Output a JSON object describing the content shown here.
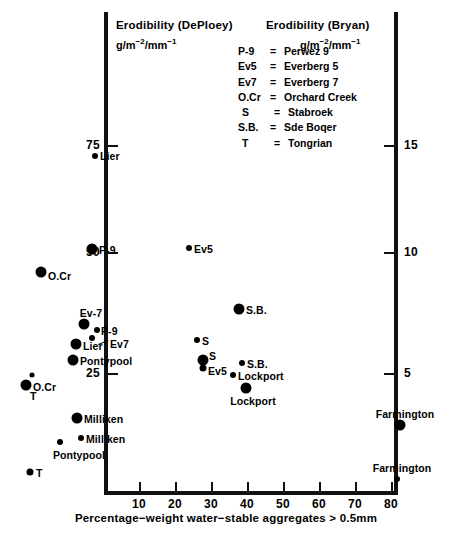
{
  "axes": {
    "left_title": "Erodibility (DePloey)",
    "left_units_html": "g/m",
    "right_title": "Erodibility (Bryan)",
    "right_units_html": "g/m",
    "x_title": "Percentage−weight water−stable aggregates  >  0.5mm",
    "left_ticks": [
      "75",
      "50",
      "25"
    ],
    "right_ticks": [
      "15",
      "10",
      "5"
    ],
    "x_ticks": [
      "10",
      "20",
      "30",
      "40",
      "50",
      "60",
      "70",
      "80"
    ]
  },
  "legend": {
    "rows": [
      {
        "key": "P-9",
        "eq": "=",
        "value": "Perwez 9"
      },
      {
        "key": "Ev5",
        "eq": "=",
        "value": "Everberg 5"
      },
      {
        "key": "Ev7",
        "eq": "=",
        "value": "Everberg 7"
      },
      {
        "key": "O.Cr",
        "eq": "=",
        "value": "Orchard Creek"
      },
      {
        "key": "S",
        "eq": "=",
        "value": "Stabroek"
      },
      {
        "key": "S.B.",
        "eq": "=",
        "value": "Sde Boqer"
      },
      {
        "key": "T",
        "eq": "=",
        "value": "Tongrian"
      }
    ]
  },
  "chart_data": {
    "type": "scatter",
    "title": "",
    "xlabel": "Percentage−weight water−stable aggregates > 0.5mm",
    "ylabel_left": "Erodibility (DePloey) g/m^-2/mm^-1",
    "ylabel_right": "Erodibility (Bryan) g/m^-2/mm^-1",
    "xlim": [
      0,
      86
    ],
    "ylim_left": [
      0,
      86
    ],
    "ylim_right": [
      0,
      17.2
    ],
    "grid": false,
    "legend_position": "top-right",
    "series": [
      {
        "name": "DePloey (large markers, left axis)",
        "marker": "filled-circle-large",
        "axis": "left",
        "points": [
          {
            "label": "P-9",
            "x": 11.0,
            "y": 50.5
          },
          {
            "label": "O.Cr",
            "x": 1.5,
            "y": 45.0
          },
          {
            "label": "Ev-7",
            "x": 8.5,
            "y": 32.8
          },
          {
            "label": "Lier",
            "x": 6.8,
            "y": 29.0
          },
          {
            "label": "Pontypool",
            "x": 6.3,
            "y": 25.5
          },
          {
            "label": "O.Cr",
            "x": 0.6,
            "y": 22.5
          },
          {
            "label": "Milliken",
            "x": 9.0,
            "y": 16.0
          },
          {
            "label": "T",
            "x": 0.6,
            "y": 8.5
          },
          {
            "label": "S.B.",
            "x": 38.5,
            "y": 35.0
          },
          {
            "label": "S",
            "x": 34.0,
            "y": 25.5
          },
          {
            "label": "Lockport",
            "x": 45.5,
            "y": 20.5
          },
          {
            "label": "Farmington",
            "x": 77.5,
            "y": 16.5
          }
        ]
      },
      {
        "name": "Bryan (small markers, right axis)",
        "marker": "filled-circle-small",
        "axis": "right",
        "points": [
          {
            "label": "Lier",
            "x": 7.0,
            "y_left": 72.0,
            "y_right": 14.4
          },
          {
            "label": "Ev5",
            "x": 30.5,
            "y_left": 50.5,
            "y_right": 10.1
          },
          {
            "label": "P-9",
            "x": 10.5,
            "y_left": 31.0,
            "y_right": 6.2
          },
          {
            "label": "Ev7",
            "x": 9.0,
            "y_left": 29.5,
            "y_right": 5.9
          },
          {
            "label": "S",
            "x": 32.5,
            "y_left": 27.5,
            "y_right": 5.5
          },
          {
            "label": "Ev5",
            "x": 34.0,
            "y_left": 24.5,
            "y_right": 4.9
          },
          {
            "label": "S.B.",
            "x": 43.0,
            "y_left": 24.5,
            "y_right": 4.9
          },
          {
            "label": "Lockport",
            "x": 41.5,
            "y_left": 22.0,
            "y_right": 4.4
          },
          {
            "label": "T",
            "x": 1.0,
            "y_left": 23.5,
            "y_right": 4.7
          },
          {
            "label": "Milliken",
            "x": 11.5,
            "y_left": 12.5,
            "y_right": 2.5
          },
          {
            "label": "Pontypool",
            "x": 7.5,
            "y_left": 10.0,
            "y_right": 2.0
          },
          {
            "label": "Farmington",
            "x": 77.0,
            "y_left": 3.5,
            "y_right": 0.7
          }
        ]
      }
    ]
  },
  "points": [
    {
      "id": "lier-small-top",
      "name": "Lier",
      "px": 95,
      "py": 156,
      "r": 3.0,
      "lbl": "right",
      "lx": 100,
      "ly": 156
    },
    {
      "id": "p9-large",
      "name": "P-9",
      "px": 92,
      "py": 249,
      "r": 5.5,
      "lbl": "right",
      "lx": 99,
      "ly": 250
    },
    {
      "id": "ev5-small",
      "name": "Ev5",
      "px": 189,
      "py": 248,
      "r": 3.0,
      "lbl": "right",
      "lx": 194,
      "ly": 249
    },
    {
      "id": "ocr-large-top",
      "name": "O.Cr",
      "px": 41,
      "py": 272,
      "r": 5.5,
      "lbl": "right",
      "lx": 48,
      "ly": 276
    },
    {
      "id": "sb-large",
      "name": "S.B.",
      "px": 239,
      "py": 309,
      "r": 5.5,
      "lbl": "right",
      "lx": 246,
      "ly": 310
    },
    {
      "id": "ev7-large",
      "name": "Ev-7",
      "px": 84,
      "py": 324,
      "r": 5.5,
      "lbl": "above",
      "lx": 91,
      "ly": 319
    },
    {
      "id": "p9-small",
      "name": "P-9",
      "px": 97,
      "py": 330,
      "r": 3.0,
      "lbl": "right",
      "lx": 101,
      "ly": 331
    },
    {
      "id": "ev7-small",
      "name": "Ev7",
      "px": 92,
      "py": 338,
      "r": 3.0,
      "lbl": "right",
      "lx": 110,
      "ly": 344
    },
    {
      "id": "lier-large",
      "name": "Lier",
      "px": 76,
      "py": 344,
      "r": 5.5,
      "lbl": "right",
      "lx": 83,
      "ly": 346
    },
    {
      "id": "s-small",
      "name": "S",
      "px": 197,
      "py": 340,
      "r": 3.0,
      "lbl": "right",
      "lx": 202,
      "ly": 341
    },
    {
      "id": "pontypool-large",
      "name": "Pontypool",
      "px": 73,
      "py": 360,
      "r": 5.5,
      "lbl": "right",
      "lx": 80,
      "ly": 361
    },
    {
      "id": "s-large",
      "name": "S",
      "px": 203,
      "py": 360,
      "r": 5.5,
      "lbl": "right",
      "lx": 209,
      "ly": 356
    },
    {
      "id": "ev5-small-2",
      "name": "Ev5",
      "px": 203,
      "py": 368,
      "r": 3.5,
      "lbl": "right",
      "lx": 208,
      "ly": 371
    },
    {
      "id": "sb-small",
      "name": "S.B.",
      "px": 242,
      "py": 363,
      "r": 3.0,
      "lbl": "right",
      "lx": 247,
      "ly": 364
    },
    {
      "id": "ocr-large-bot",
      "name": "O.Cr",
      "px": 26,
      "py": 385,
      "r": 5.5,
      "lbl": "right",
      "lx": 33,
      "ly": 387
    },
    {
      "id": "t-small-top",
      "name": "",
      "px": 32,
      "py": 375,
      "r": 2.5,
      "lbl": "none",
      "lx": 0,
      "ly": 0
    },
    {
      "id": "t-label-top",
      "name": "T",
      "px": -1,
      "py": -1,
      "r": 0,
      "lbl": "right",
      "lx": 30,
      "ly": 396
    },
    {
      "id": "lockport-small",
      "name": "Lockport",
      "px": 233,
      "py": 375,
      "r": 3.0,
      "lbl": "right",
      "lx": 238,
      "ly": 376
    },
    {
      "id": "lockport-large",
      "name": "Lockport",
      "px": 246,
      "py": 388,
      "r": 5.5,
      "lbl": "below",
      "lx": 253,
      "ly": 395
    },
    {
      "id": "milliken-large",
      "name": "Milliken",
      "px": 77,
      "py": 418,
      "r": 5.5,
      "lbl": "right",
      "lx": 84,
      "ly": 419
    },
    {
      "id": "farmington-large",
      "name": "Farmington",
      "px": 400,
      "py": 425,
      "r": 5.5,
      "lbl": "above",
      "lx": 405,
      "ly": 420
    },
    {
      "id": "milliken-small",
      "name": "Milliken",
      "px": 81,
      "py": 438,
      "r": 3.0,
      "lbl": "right",
      "lx": 86,
      "ly": 439
    },
    {
      "id": "pontypool-small",
      "name": "Pontypool",
      "px": 60,
      "py": 442,
      "r": 3.0,
      "lbl": "below",
      "lx": 79,
      "ly": 449
    },
    {
      "id": "t-small-bot",
      "name": "T",
      "px": 30,
      "py": 472,
      "r": 3.5,
      "lbl": "right",
      "lx": 36,
      "ly": 473
    },
    {
      "id": "farmington-small",
      "name": "Farmington",
      "px": 397,
      "py": 479,
      "r": 3.0,
      "lbl": "above",
      "lx": 402,
      "ly": 474
    }
  ]
}
